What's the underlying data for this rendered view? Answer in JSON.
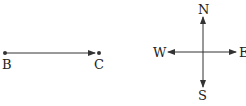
{
  "segment": {
    "start_label": "B",
    "end_label": "C",
    "start": [
      5,
      53
    ],
    "end": [
      99,
      53
    ]
  },
  "compass": {
    "center": [
      203,
      52
    ],
    "north_label": "N",
    "south_label": "S",
    "west_label": "W",
    "east_label": "E"
  },
  "colors": {
    "line": "#333333",
    "text": "#222222",
    "background": "#ffffff"
  }
}
